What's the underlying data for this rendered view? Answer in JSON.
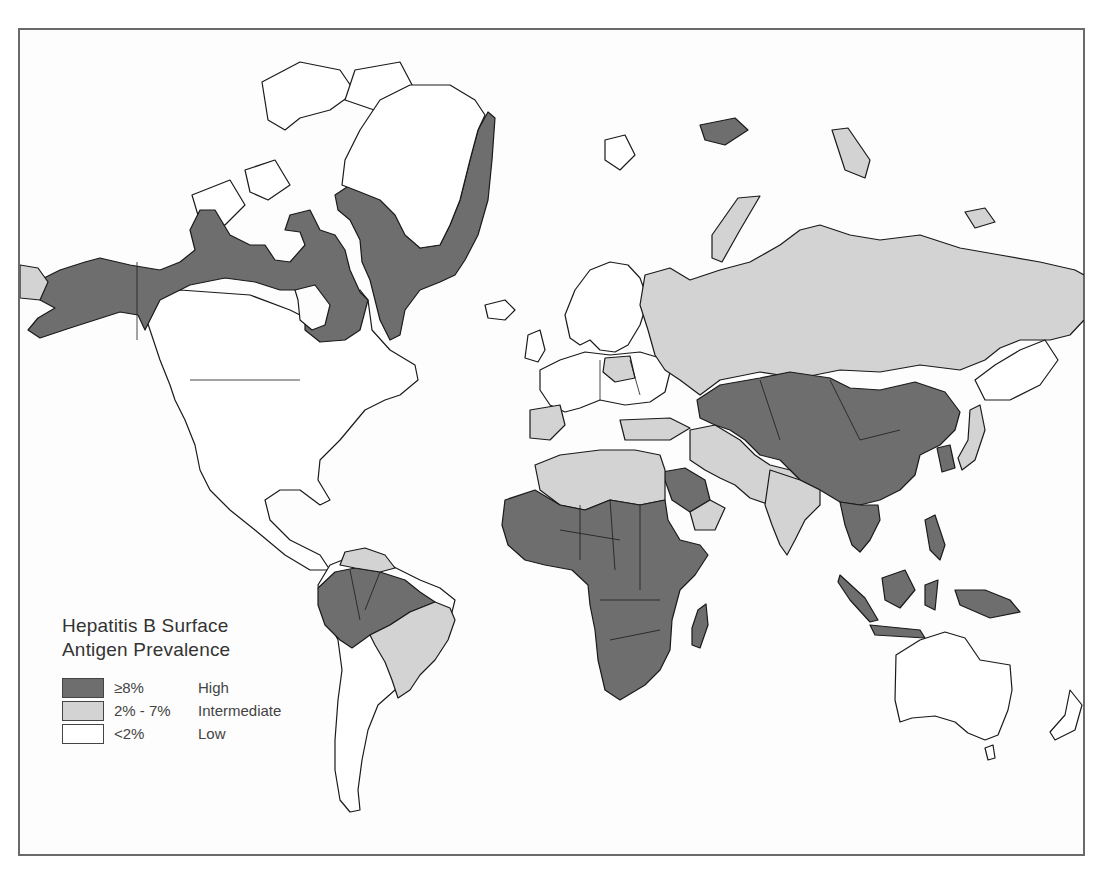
{
  "map": {
    "subject": "Hepatitis B Surface Antigen Prevalence",
    "colors": {
      "high": "#6e6e6e",
      "intermediate": "#d3d3d3",
      "low": "#ffffff",
      "outline": "#1a1a1a",
      "frame": "#6a6a6a"
    },
    "regions": {
      "high": [
        "Alaska",
        "Northern Canada",
        "Greenland (coastal)",
        "Sub-Saharan Africa",
        "Saudi Arabia",
        "Central Asia",
        "Mongolia",
        "China",
        "Southeast Asia",
        "Indonesia",
        "Philippines",
        "Papua New Guinea",
        "Amazon basin",
        "Madagascar"
      ],
      "intermediate": [
        "Russia",
        "Eastern Europe (parts)",
        "Spain/Portugal",
        "North Africa",
        "Middle East",
        "Iran",
        "India",
        "Pakistan",
        "Eastern Brazil",
        "Venezuela/Guianas",
        "Japan",
        "Central America (parts)"
      ],
      "low": [
        "Southern Canada",
        "United States",
        "Mexico",
        "Western Europe",
        "Scandinavia",
        "Southern South America",
        "Australia",
        "New Zealand",
        "Northern Greenland"
      ]
    }
  },
  "legend": {
    "title_line1": "Hepatitis B Surface",
    "title_line2": "Antigen Prevalence",
    "items": [
      {
        "range": "≥8%",
        "level": "High",
        "color": "#6e6e6e"
      },
      {
        "range": "2% - 7%",
        "level": "Intermediate",
        "color": "#d3d3d3"
      },
      {
        "range": "<2%",
        "level": "Low",
        "color": "#ffffff"
      }
    ]
  }
}
